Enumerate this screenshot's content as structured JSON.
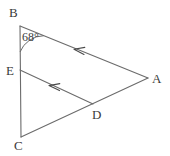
{
  "figure": {
    "kind": "geometry-diagram",
    "background_color": "#ffffff",
    "stroke_color": "#6b6b6b",
    "label_color": "#3a3a3a",
    "width": 170,
    "height": 156
  },
  "points": {
    "B": {
      "label": "B",
      "x": 20,
      "y": 26,
      "label_x": 9,
      "label_y": 6
    },
    "E": {
      "label": "E",
      "x": 20,
      "y": 70,
      "label_x": 6,
      "label_y": 65
    },
    "C": {
      "label": "C",
      "x": 21,
      "y": 137,
      "label_x": 14,
      "label_y": 139
    },
    "D": {
      "label": "D",
      "x": 93,
      "y": 104,
      "label_x": 92,
      "label_y": 108
    },
    "A": {
      "label": "A",
      "x": 148,
      "y": 78,
      "label_x": 152,
      "label_y": 73
    }
  },
  "segments": [
    {
      "name": "segment-BC",
      "from": "B",
      "to": "C"
    },
    {
      "name": "segment-BA",
      "from": "B",
      "to": "A"
    },
    {
      "name": "segment-ED",
      "from": "E",
      "to": "D"
    },
    {
      "name": "segment-CA",
      "from": "C",
      "to": "A"
    }
  ],
  "arrow_marks": [
    {
      "name": "arrow-mark-BA",
      "on_segment": "segment-BA",
      "x": 78,
      "y": 50,
      "direction": "toward-B"
    },
    {
      "name": "arrow-mark-ED",
      "on_segment": "segment-ED",
      "x": 53,
      "y": 86,
      "direction": "toward-E"
    }
  ],
  "angles": [
    {
      "name": "angle-B",
      "vertex": "B",
      "value": "68°",
      "label_x": 22,
      "label_y": 31
    }
  ]
}
